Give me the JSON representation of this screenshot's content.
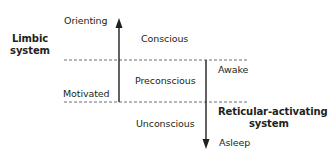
{
  "diagram": {
    "type": "states-of-consciousness",
    "left_system": {
      "label_line1": "Limbic",
      "label_line2": "system"
    },
    "right_system": {
      "label_line1": "Reticular-activating",
      "label_line2": "system"
    },
    "up_axis": {
      "top_label": "Orienting",
      "bottom_label": "Motivated",
      "direction": "up"
    },
    "down_axis": {
      "top_label": "Awake",
      "bottom_label": "Asleep",
      "direction": "down"
    },
    "levels": [
      {
        "name": "Conscious"
      },
      {
        "name": "Preconscious"
      },
      {
        "name": "Unconscious"
      }
    ],
    "colors": {
      "line": "#231f20",
      "dashed": "#6d6e71",
      "background": "#ffffff"
    }
  }
}
